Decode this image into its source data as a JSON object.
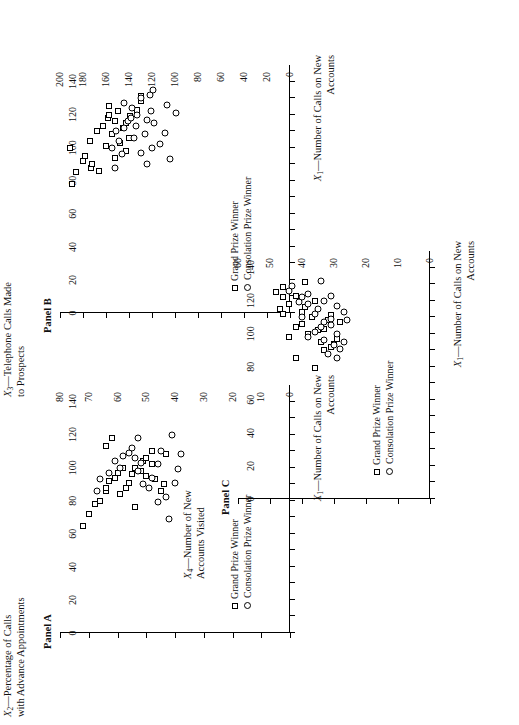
{
  "figure": {
    "legend": {
      "grand": "Grand Prize Winner",
      "consolation": "Consolation Prize Winner"
    }
  },
  "chart_data": [
    {
      "id": "panel-a",
      "type": "scatter",
      "title": "Panel A",
      "xlabel": "X₁—Number of Calls on New\nAccounts",
      "xlabel_line1": "—Number of Calls on New",
      "xlabel_line2": "Accounts",
      "xvar": "X",
      "xsub": "1",
      "ylabel_line1": "—Percentage of Calls",
      "ylabel_line2": "with Advance Appointments",
      "yvar": "X",
      "ysub": "2",
      "xlim": [
        0,
        150
      ],
      "ylim": [
        0,
        80
      ],
      "xticks": [
        0,
        10,
        20,
        30,
        40,
        50,
        60,
        70,
        80,
        90,
        100,
        110,
        120,
        130,
        140
      ],
      "xticklabels": [
        "0",
        "",
        "20",
        "",
        "40",
        "",
        "60",
        "",
        "80",
        "",
        "100",
        "",
        "120",
        "",
        "140"
      ],
      "yticks": [
        0,
        10,
        20,
        30,
        40,
        50,
        60,
        70,
        80
      ],
      "yticklabels": [
        "0",
        "10",
        "20",
        "30",
        "40",
        "50",
        "60",
        "70",
        "80"
      ],
      "grid": false,
      "legend_position": "inside-lower-left",
      "series": [
        {
          "name": "Grand Prize Winner",
          "marker": "square",
          "points": [
            [
              65,
              72
            ],
            [
              72,
              70
            ],
            [
              78,
              68
            ],
            [
              80,
              66
            ],
            [
              86,
              64
            ],
            [
              88,
              64
            ],
            [
              92,
              63
            ],
            [
              94,
              61
            ],
            [
              88,
              57
            ],
            [
              91,
              56
            ],
            [
              96,
              55
            ],
            [
              100,
              54
            ],
            [
              98,
              52
            ],
            [
              104,
              51
            ],
            [
              106,
              50
            ],
            [
              102,
              48
            ],
            [
              110,
              48
            ],
            [
              93,
              47
            ],
            [
              86,
              45
            ],
            [
              90,
              44
            ],
            [
              108,
              43
            ],
            [
              113,
              64
            ],
            [
              118,
              62
            ],
            [
              100,
              58
            ],
            [
              97,
              60
            ],
            [
              84,
              59
            ],
            [
              76,
              54
            ],
            [
              95,
              50
            ]
          ]
        },
        {
          "name": "Consolation Prize Winner",
          "marker": "circle",
          "points": [
            [
              86,
              67
            ],
            [
              93,
              66
            ],
            [
              97,
              63
            ],
            [
              104,
              61
            ],
            [
              100,
              59
            ],
            [
              107,
              58
            ],
            [
              109,
              56
            ],
            [
              112,
              55
            ],
            [
              106,
              54
            ],
            [
              98,
              53
            ],
            [
              103,
              52
            ],
            [
              90,
              51
            ],
            [
              88,
              49
            ],
            [
              94,
              48
            ],
            [
              102,
              46
            ],
            [
              110,
              45
            ],
            [
              118,
              53
            ],
            [
              120,
              41
            ],
            [
              99,
              39
            ],
            [
              82,
              43
            ],
            [
              79,
              46
            ],
            [
              69,
              42
            ],
            [
              91,
              40
            ],
            [
              108,
              38
            ]
          ]
        }
      ]
    },
    {
      "id": "panel-b",
      "type": "scatter",
      "title": "Panel B",
      "xlabel_line1": "—Number of Calls on New",
      "xlabel_line2": "Accounts",
      "xvar": "X",
      "xsub": "1",
      "ylabel_line1": "—Telephone Calls Made",
      "ylabel_line2": "to Prospects",
      "yvar": "X",
      "ysub": "3",
      "xlim": [
        0,
        150
      ],
      "ylim": [
        0,
        200
      ],
      "xticks": [
        0,
        10,
        20,
        30,
        40,
        50,
        60,
        70,
        80,
        90,
        100,
        110,
        120,
        130,
        140
      ],
      "xticklabels": [
        "0",
        "",
        "20",
        "",
        "40",
        "",
        "60",
        "",
        "80",
        "",
        "100",
        "",
        "120",
        "",
        "140"
      ],
      "yticks": [
        0,
        20,
        40,
        60,
        80,
        100,
        120,
        140,
        160,
        180,
        200
      ],
      "yticklabels": [
        "0",
        "20",
        "40",
        "60",
        "80",
        "100",
        "120",
        "140",
        "160",
        "180",
        "200"
      ],
      "grid": false,
      "legend_position": "inside-lower-left",
      "series": [
        {
          "name": "Grand Prize Winner",
          "marker": "square",
          "points": [
            [
              78,
              190
            ],
            [
              85,
              186
            ],
            [
              92,
              180
            ],
            [
              95,
              178
            ],
            [
              88,
              173
            ],
            [
              90,
              172
            ],
            [
              100,
              191
            ],
            [
              104,
              174
            ],
            [
              110,
              168
            ],
            [
              113,
              163
            ],
            [
              118,
              158
            ],
            [
              120,
              157
            ],
            [
              108,
              155
            ],
            [
              116,
              152
            ],
            [
              122,
              150
            ],
            [
              125,
              157
            ],
            [
              103,
              148
            ],
            [
              112,
              145
            ],
            [
              98,
              143
            ],
            [
              106,
              140
            ],
            [
              119,
              139
            ],
            [
              123,
              133
            ],
            [
              128,
              130
            ],
            [
              131,
              130
            ],
            [
              94,
              152
            ],
            [
              101,
              160
            ],
            [
              86,
              166
            ],
            [
              115,
              143
            ]
          ]
        },
        {
          "name": "Consolation Prize Winner",
          "marker": "circle",
          "points": [
            [
              88,
              152
            ],
            [
              96,
              146
            ],
            [
              100,
              155
            ],
            [
              104,
              149
            ],
            [
              110,
              151
            ],
            [
              112,
              144
            ],
            [
              116,
              141
            ],
            [
              118,
              138
            ],
            [
              106,
              136
            ],
            [
              113,
              134
            ],
            [
              120,
              133
            ],
            [
              124,
              137
            ],
            [
              127,
              144
            ],
            [
              130,
              130
            ],
            [
              97,
              130
            ],
            [
              108,
              126
            ],
            [
              117,
              124
            ],
            [
              122,
              121
            ],
            [
              100,
              120
            ],
            [
              90,
              124
            ],
            [
              132,
              122
            ],
            [
              135,
              119
            ],
            [
              115,
              118
            ],
            [
              102,
              113
            ],
            [
              109,
              109
            ],
            [
              126,
              107
            ],
            [
              121,
              99
            ],
            [
              93,
              104
            ]
          ]
        }
      ]
    },
    {
      "id": "panel-c",
      "type": "scatter",
      "title": "Panel C",
      "xlabel_line1": "—Number of Calls on New",
      "xlabel_line2": "Accounts",
      "xvar": "X",
      "xsub": "1",
      "ylabel_line1": "—Number of New",
      "ylabel_line2": "Accounts Visited",
      "yvar": "X",
      "ysub": "4",
      "xlim": [
        0,
        150
      ],
      "ylim": [
        0,
        60
      ],
      "xticks": [
        0,
        10,
        20,
        30,
        40,
        50,
        60,
        70,
        80,
        90,
        100,
        110,
        120,
        130,
        140
      ],
      "xticklabels": [
        "0",
        "",
        "20",
        "",
        "40",
        "",
        "60",
        "",
        "80",
        "",
        "100",
        "",
        "120",
        "",
        "140"
      ],
      "yticks": [
        0,
        10,
        20,
        30,
        40,
        50,
        60
      ],
      "yticklabels": [
        "0",
        "10",
        "20",
        "30",
        "40",
        "50",
        "60"
      ],
      "grid": false,
      "legend_position": "inside-lower-left",
      "series": [
        {
          "name": "Grand Prize Winner",
          "marker": "square",
          "points": [
            [
              85,
              42
            ],
            [
              79,
              36
            ],
            [
              92,
              31
            ],
            [
              95,
              34
            ],
            [
              98,
              44
            ],
            [
              104,
              42
            ],
            [
              106,
              40
            ],
            [
              100,
              38
            ],
            [
              110,
              37
            ],
            [
              103,
              33
            ],
            [
              108,
              32
            ],
            [
              112,
              46
            ],
            [
              115,
              47
            ],
            [
              118,
              44
            ],
            [
              122,
              46
            ],
            [
              128,
              46
            ],
            [
              113,
              40
            ],
            [
              116,
              39
            ],
            [
              94,
              30
            ],
            [
              120,
              36
            ],
            [
              125,
              48
            ],
            [
              131,
              39
            ],
            [
              102,
              35
            ],
            [
              90,
              33
            ],
            [
              97,
              29
            ],
            [
              107,
              28
            ],
            [
              111,
              31
            ],
            [
              123,
              42
            ]
          ]
        },
        {
          "name": "Consolation Prize Winner",
          "marker": "circle",
          "points": [
            [
              88,
              32
            ],
            [
              93,
              30
            ],
            [
              98,
              38
            ],
            [
              101,
              36
            ],
            [
              104,
              34
            ],
            [
              107,
              33
            ],
            [
              109,
              31
            ],
            [
              112,
              36
            ],
            [
              115,
              35
            ],
            [
              118,
              38
            ],
            [
              120,
              33
            ],
            [
              123,
              31
            ],
            [
              126,
              44
            ],
            [
              129,
              43
            ],
            [
              119,
              41
            ],
            [
              110,
              40
            ],
            [
              105,
              31
            ],
            [
              100,
              29
            ],
            [
              95,
              27
            ],
            [
              91,
              28
            ],
            [
              113,
              27
            ],
            [
              117,
              29
            ],
            [
              124,
              38
            ],
            [
              108,
              26
            ],
            [
              85,
              29
            ],
            [
              132,
              34
            ],
            [
              122,
              40
            ],
            [
              96,
              33
            ]
          ]
        }
      ]
    }
  ]
}
